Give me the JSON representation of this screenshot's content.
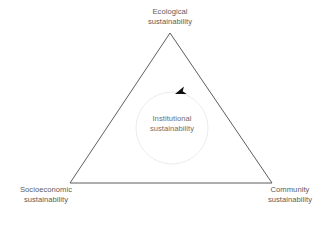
{
  "diagram": {
    "background_color": "#ffffff",
    "triangle": {
      "stroke_color": "#4a4a4a",
      "stroke_width": 0.9,
      "vertices": {
        "top": [
          170,
          33
        ],
        "bottom_left": [
          70,
          183
        ],
        "bottom_right": [
          272,
          183
        ]
      }
    },
    "circle": {
      "stroke_color": "#ececec",
      "stroke_width": 1,
      "center": [
        172,
        128
      ],
      "radius": 36
    },
    "arrow": {
      "icon": "arrowhead-left-icon",
      "color": "#111111",
      "position": [
        175,
        94
      ],
      "direction": "counterclockwise-left"
    },
    "labels": {
      "ecological": {
        "name": "Ecological sustainability",
        "line1": "Ecological",
        "line2": "sustainability",
        "color": "#5c5c5c"
      },
      "socioeconomic": {
        "name": "Socioeconomic sustainability",
        "line1": "Socioeconomic",
        "line2": "sustainability",
        "color": "#5c5c5c"
      },
      "community": {
        "name": "Community sustainability",
        "line1": "Community",
        "line2": "sustainability",
        "color": "#5c5c5c"
      },
      "institutional": {
        "name": "Institutional sustainability",
        "line1": "Institutional",
        "line2": "sustainability",
        "color": "#6e6e6e"
      }
    }
  }
}
